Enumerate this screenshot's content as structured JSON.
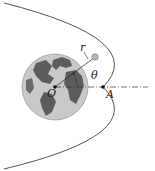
{
  "diagram": {
    "labels": {
      "origin": "O",
      "point": "A",
      "radius": "r",
      "angle": "θ"
    },
    "colors": {
      "curve": "#555555",
      "earth_ocean": "#c8c8c8",
      "earth_land": "#5a5a5a",
      "satellite": "#b0b0b0",
      "axis": "#333333"
    }
  }
}
